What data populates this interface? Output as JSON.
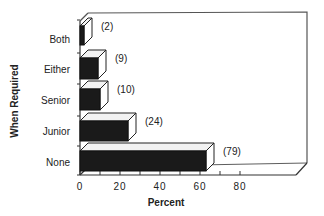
{
  "chart_data": {
    "type": "bar",
    "orientation": "horizontal",
    "style": "3d",
    "title": "",
    "xlabel": "Percent",
    "ylabel": "When Required",
    "categories": [
      "Both",
      "Either",
      "Senior",
      "Junior",
      "None"
    ],
    "values": [
      2,
      9,
      10,
      24,
      79
    ],
    "value_labels": [
      "(2)",
      "(9)",
      "(10)",
      "(24)",
      "(79)"
    ],
    "bar_lengths_percent": [
      2,
      9,
      10,
      24,
      63
    ],
    "xlim": [
      0,
      80
    ],
    "xticks": [
      "0",
      "20",
      "40",
      "60",
      "80"
    ],
    "grid": false,
    "legend": null,
    "colors": {
      "bar_front": "#1a1a1a",
      "bar_top": "#f2f2f2",
      "bar_side": "#ffffff",
      "axis": "#333333"
    }
  }
}
